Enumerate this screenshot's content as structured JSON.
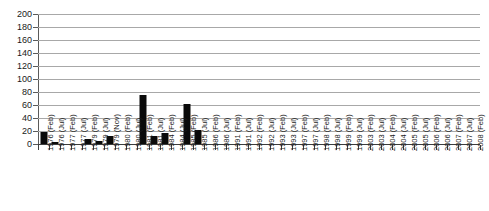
{
  "chart_data": {
    "type": "bar",
    "title": "",
    "subtitle": "",
    "xlabel": "",
    "ylabel": "",
    "ylim": [
      0,
      200
    ],
    "ytick_step": 20,
    "yticks": [
      200,
      180,
      160,
      140,
      120,
      100,
      80,
      60,
      40,
      20,
      0
    ],
    "grid": true,
    "legend": false,
    "bar_color": "#0a0a0a",
    "gridline_color": "#a8a8a8",
    "axis_color": "#3d3d3d",
    "categories": [
      "1976 (Feb)",
      "1976 (Jul)",
      "1977 (Feb)",
      "1977 (Jul)",
      "1979 (Feb)",
      "1979 (Jul)",
      "1979 (Nov)",
      "1980 (Feb)",
      "1980 (Jul)",
      "1981 (Feb)",
      "1981 (Jul)",
      "1984 (Feb)",
      "1984 (Jul)",
      "1985 (Feb)",
      "1985 (Jul)",
      "1986 (Feb)",
      "1986 (Jul)",
      "1991 (Feb)",
      "1991 (Jul)",
      "1992 (Feb)",
      "1992 (Jul)",
      "1993 (Feb)",
      "1993 (Jul)",
      "1997 (Feb)",
      "1997 (Jul)",
      "1998 (Feb)",
      "1998 (Jul)",
      "1999 (Feb)",
      "1999 (Jul)",
      "2003 (Feb)",
      "2003 (Jul)",
      "2004 (Feb)",
      "2004 (Jul)",
      "2005 (Feb)",
      "2005 (Jul)",
      "2006 (Feb)",
      "2006 (Jul)",
      "2007 (Feb)",
      "2007 (Jul)",
      "2008 (Feb)"
    ],
    "values": [
      18,
      3,
      0,
      0,
      8,
      5,
      12,
      0,
      0,
      75,
      12,
      17,
      0,
      62,
      22,
      0,
      0,
      0,
      0,
      0,
      0,
      0,
      0,
      0,
      0,
      0,
      0,
      0,
      0,
      0,
      0,
      0,
      0,
      0,
      0,
      0,
      0,
      0,
      0,
      0
    ]
  }
}
